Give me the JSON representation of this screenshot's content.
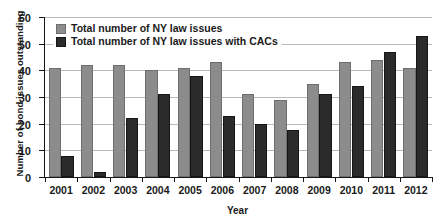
{
  "chart_data": {
    "type": "bar",
    "title": "",
    "xlabel": "Year",
    "ylabel": "Number of bond issues outstanding",
    "categories": [
      "2001",
      "2002",
      "2003",
      "2004",
      "2005",
      "2006",
      "2007",
      "2008",
      "2009",
      "2010",
      "2011",
      "2012"
    ],
    "series": [
      {
        "name": "Total number of NY law issues",
        "color": "#8c8c8c",
        "values": [
          41,
          42,
          42,
          40,
          41,
          43,
          31,
          29,
          35,
          43,
          44,
          41
        ]
      },
      {
        "name": "Total number of NY law issues with CACs",
        "color": "#2b2b2b",
        "values": [
          8,
          2,
          22,
          31,
          38,
          23,
          20,
          17.5,
          31,
          34,
          47,
          53
        ]
      }
    ],
    "ylim": [
      0,
      60
    ],
    "yticks": [
      0,
      10,
      20,
      30,
      40,
      50,
      60
    ],
    "ytick_labels": [
      "0",
      "10",
      "20",
      "30",
      "40",
      "50",
      "60"
    ],
    "grid": "horizontal",
    "legend_position": "upper-left-inside"
  }
}
